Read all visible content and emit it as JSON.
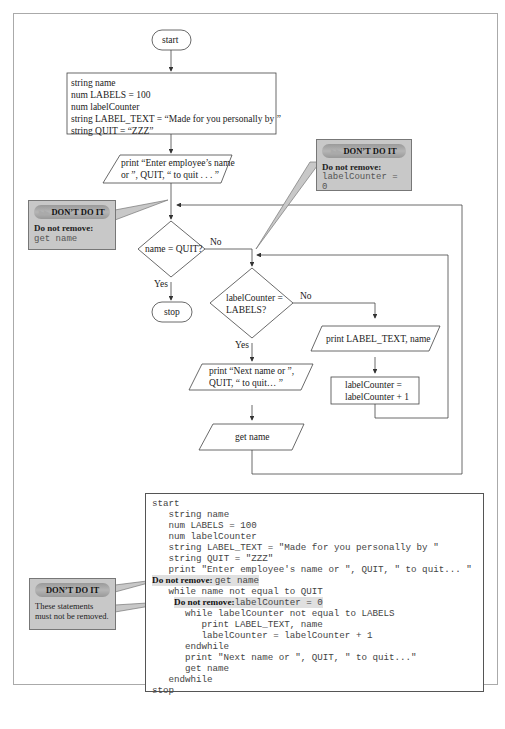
{
  "flowchart": {
    "start": "start",
    "declarations": [
      "string name",
      "num LABELS = 100",
      "num labelCounter",
      "string LABEL_TEXT = “Made for you personally by ”",
      "string QUIT = “ZZZ”"
    ],
    "prompt_lines": [
      "print “Enter employee’s name",
      "or ”, QUIT, “ to quit . . . ”"
    ],
    "decision_quit": "name = QUIT?",
    "decision_quit_no": "No",
    "decision_quit_yes": "Yes",
    "stop": "stop",
    "decision_labels_lines": [
      "labelCounter =",
      "LABELS?"
    ],
    "decision_labels_no": "No",
    "decision_labels_yes": "Yes",
    "print_label": "print LABEL_TEXT, name",
    "increment_lines": [
      "labelCounter =",
      "labelCounter + 1"
    ],
    "next_prompt_lines": [
      "print “Next name or ”,",
      "QUIT, “ to quit… ”"
    ],
    "get_name": "get name"
  },
  "callouts": {
    "top_right": {
      "badge": "DON’T DO IT",
      "bold": "Do not remove:",
      "code": "labelCounter = 0"
    },
    "left": {
      "badge": "DON’T DO IT",
      "bold": "Do not remove:",
      "code": "get name"
    },
    "bottom": {
      "badge": "DON’T DO IT",
      "text": "These statements must not be removed."
    }
  },
  "pseudocode": {
    "lines": [
      {
        "indent": 0,
        "text": "start"
      },
      {
        "indent": 1,
        "text": "string name"
      },
      {
        "indent": 1,
        "text": "num LABELS = 100"
      },
      {
        "indent": 1,
        "text": "num labelCounter"
      },
      {
        "indent": 1,
        "text": "string LABEL_TEXT = \"Made for you personally by \""
      },
      {
        "indent": 1,
        "text": "string QUIT = \"ZZZ\""
      },
      {
        "indent": 1,
        "text": "print \"Enter employee's name or \", QUIT, \" to quit... \""
      },
      {
        "indent": 0,
        "bold": "Do not remove: ",
        "text": "get name",
        "highlight": true
      },
      {
        "indent": 1,
        "text": "while name not equal to QUIT"
      },
      {
        "indent": 1,
        "bold": "Do not remove:",
        "text": "labelCounter = 0",
        "highlight": true,
        "offset": 1
      },
      {
        "indent": 2,
        "text": "while labelCounter not equal to LABELS"
      },
      {
        "indent": 3,
        "text": "print LABEL_TEXT, name"
      },
      {
        "indent": 3,
        "text": "labelCounter = labelCounter + 1"
      },
      {
        "indent": 2,
        "text": "endwhile"
      },
      {
        "indent": 2,
        "text": "print \"Next name or \", QUIT, \" to quit...\""
      },
      {
        "indent": 2,
        "text": "get name"
      },
      {
        "indent": 1,
        "text": "endwhile"
      },
      {
        "indent": 0,
        "text": "stop"
      }
    ]
  }
}
